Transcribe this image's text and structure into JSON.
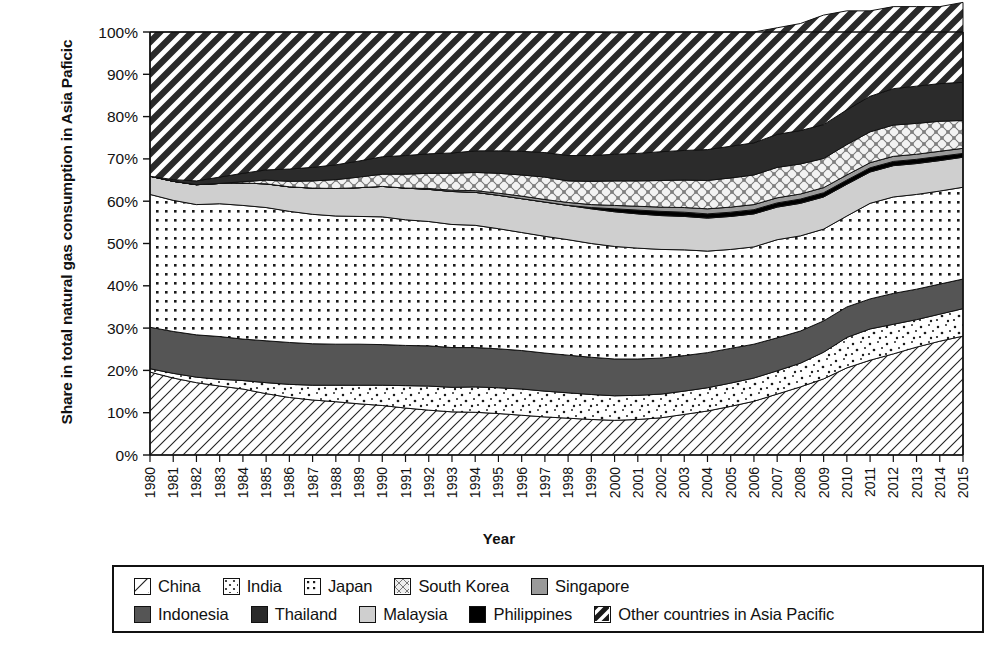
{
  "chart_data": {
    "type": "area",
    "title": "",
    "xlabel": "Year",
    "ylabel": "Share in total natural gas consumption in Asia Paficic",
    "stacked": true,
    "normalized": true,
    "grid": false,
    "legend_position": "bottom",
    "ylim": [
      0,
      100
    ],
    "ytick_labels": [
      "0%",
      "10%",
      "20%",
      "30%",
      "40%",
      "50%",
      "60%",
      "70%",
      "80%",
      "90%",
      "100%"
    ],
    "ytick_values": [
      0,
      10,
      20,
      30,
      40,
      50,
      60,
      70,
      80,
      90,
      100
    ],
    "categories": [
      "1980",
      "1981",
      "1982",
      "1983",
      "1984",
      "1985",
      "1986",
      "1987",
      "1988",
      "1989",
      "1990",
      "1991",
      "1992",
      "1993",
      "1994",
      "1995",
      "1996",
      "1997",
      "1998",
      "1999",
      "2000",
      "2001",
      "2002",
      "2003",
      "2004",
      "2005",
      "2006",
      "2007",
      "2008",
      "2009",
      "2010",
      "2011",
      "2012",
      "2013",
      "2014",
      "2015"
    ],
    "series": [
      {
        "name": "China",
        "pattern": "diagonal-hatch-light",
        "values": [
          19.6,
          18.2,
          17.1,
          16.3,
          15.6,
          14.5,
          13.6,
          13.0,
          12.6,
          12.1,
          11.7,
          11.1,
          10.6,
          10.2,
          10.1,
          9.8,
          9.4,
          9.0,
          8.7,
          8.4,
          8.2,
          8.4,
          8.8,
          9.6,
          10.4,
          11.5,
          12.7,
          14.4,
          16.1,
          18.0,
          20.6,
          22.4,
          23.9,
          25.5,
          26.9,
          28.1
        ]
      },
      {
        "name": "India",
        "pattern": "sparse-dots",
        "values": [
          0.8,
          1.1,
          1.3,
          1.6,
          2.0,
          2.6,
          3.1,
          3.5,
          3.9,
          4.4,
          4.8,
          5.3,
          5.7,
          5.8,
          6.0,
          6.1,
          6.2,
          6.1,
          6.0,
          5.9,
          5.8,
          5.7,
          5.6,
          5.5,
          5.5,
          5.5,
          5.5,
          5.5,
          5.6,
          6.3,
          7.2,
          7.4,
          7.0,
          6.5,
          6.4,
          6.5
        ]
      },
      {
        "name": "Indonesia",
        "pattern": "solid-dark-gray",
        "values": [
          9.8,
          9.9,
          10.0,
          10.1,
          9.8,
          9.9,
          9.9,
          9.8,
          9.7,
          9.7,
          9.6,
          9.5,
          9.5,
          9.4,
          9.3,
          9.2,
          9.1,
          9.0,
          8.9,
          8.8,
          8.7,
          8.6,
          8.5,
          8.4,
          8.3,
          8.2,
          8.0,
          7.8,
          7.6,
          7.4,
          7.2,
          7.1,
          7.3,
          7.2,
          7.1,
          7.0
        ]
      },
      {
        "name": "Japan",
        "pattern": "dot-grid",
        "values": [
          31.4,
          31.0,
          30.8,
          31.4,
          31.6,
          31.5,
          31.0,
          30.6,
          30.3,
          30.2,
          30.2,
          29.7,
          29.4,
          29.1,
          28.9,
          28.4,
          27.9,
          27.6,
          27.3,
          26.9,
          26.6,
          26.2,
          25.7,
          25.0,
          24.0,
          23.4,
          23.0,
          23.2,
          22.5,
          21.7,
          21.5,
          22.6,
          22.8,
          22.4,
          22.0,
          21.7
        ]
      },
      {
        "name": "Malaysia",
        "pattern": "solid-light-gray",
        "values": [
          4.3,
          4.5,
          4.7,
          4.8,
          5.3,
          5.6,
          5.8,
          6.2,
          6.5,
          6.8,
          7.2,
          7.5,
          7.6,
          7.8,
          7.8,
          7.9,
          8.0,
          8.1,
          8.1,
          8.2,
          8.2,
          8.1,
          8.0,
          7.9,
          7.8,
          7.8,
          7.8,
          7.7,
          7.7,
          7.6,
          7.5,
          7.4,
          7.4,
          7.3,
          7.2,
          7.1
        ]
      },
      {
        "name": "Philippines",
        "pattern": "solid-black",
        "values": [
          0.0,
          0.0,
          0.0,
          0.0,
          0.0,
          0.0,
          0.0,
          0.0,
          0.0,
          0.0,
          0.0,
          0.0,
          0.0,
          0.0,
          0.0,
          0.0,
          0.0,
          0.0,
          0.0,
          0.3,
          0.7,
          0.9,
          1.0,
          1.0,
          1.0,
          1.0,
          1.0,
          1.0,
          1.0,
          1.0,
          1.0,
          1.0,
          1.0,
          1.0,
          1.0,
          0.9
        ]
      },
      {
        "name": "Singapore",
        "pattern": "solid-medium-gray",
        "values": [
          0.0,
          0.0,
          0.0,
          0.0,
          0.0,
          0.0,
          0.0,
          0.0,
          0.0,
          0.0,
          0.0,
          0.0,
          0.2,
          0.3,
          0.4,
          0.5,
          0.6,
          0.6,
          0.7,
          0.7,
          0.8,
          0.9,
          1.0,
          1.1,
          1.2,
          1.2,
          1.2,
          1.2,
          1.2,
          1.2,
          1.2,
          1.2,
          1.2,
          1.2,
          1.2,
          1.2
        ]
      },
      {
        "name": "South Korea",
        "pattern": "cross-diamond",
        "values": [
          0.0,
          0.0,
          0.0,
          0.0,
          0.3,
          0.9,
          1.3,
          1.7,
          2.1,
          2.5,
          2.9,
          3.3,
          3.6,
          4.0,
          4.3,
          4.7,
          5.0,
          5.3,
          5.1,
          5.5,
          5.8,
          6.0,
          6.3,
          6.5,
          6.7,
          6.9,
          7.0,
          7.2,
          7.1,
          6.9,
          7.2,
          7.3,
          7.4,
          7.3,
          7.1,
          6.6
        ]
      },
      {
        "name": "Thailand",
        "pattern": "solid-very-dark",
        "values": [
          0.0,
          0.4,
          0.9,
          1.5,
          2.0,
          2.4,
          2.9,
          3.2,
          3.5,
          3.8,
          4.1,
          4.4,
          4.6,
          4.8,
          5.1,
          5.3,
          5.6,
          5.8,
          6.0,
          6.1,
          6.3,
          6.5,
          6.8,
          7.0,
          7.3,
          7.5,
          7.6,
          7.8,
          7.9,
          8.0,
          8.2,
          8.4,
          8.6,
          8.8,
          8.9,
          9.0
        ]
      },
      {
        "name": "Other countries in Asia Pacific",
        "pattern": "diagonal-hatch-heavy",
        "values": [
          34.1,
          34.9,
          35.2,
          34.3,
          33.4,
          32.6,
          32.4,
          32.0,
          31.4,
          30.5,
          29.5,
          29.2,
          28.8,
          28.6,
          28.1,
          28.1,
          28.2,
          28.5,
          29.2,
          29.2,
          28.7,
          28.7,
          28.3,
          28.0,
          27.8,
          27.0,
          26.2,
          25.2,
          25.3,
          25.9,
          23.4,
          20.2,
          19.4,
          18.8,
          18.2,
          18.9
        ]
      }
    ],
    "legend": [
      {
        "label": "China",
        "pattern": "diagonal-hatch-light"
      },
      {
        "label": "India",
        "pattern": "sparse-dots"
      },
      {
        "label": "Japan",
        "pattern": "dot-grid"
      },
      {
        "label": "South Korea",
        "pattern": "cross-diamond"
      },
      {
        "label": "Singapore",
        "pattern": "solid-medium-gray"
      },
      {
        "label": "Indonesia",
        "pattern": "solid-dark-gray"
      },
      {
        "label": "Thailand",
        "pattern": "solid-very-dark"
      },
      {
        "label": "Malaysia",
        "pattern": "solid-light-gray"
      },
      {
        "label": "Philippines",
        "pattern": "solid-black"
      },
      {
        "label": "Other countries in Asia Pacific",
        "pattern": "diagonal-hatch-heavy"
      }
    ],
    "colors": {
      "axis": "#111111",
      "solid-medium-gray": "#9a9a9a",
      "solid-dark-gray": "#555555",
      "solid-very-dark": "#2b2b2b",
      "solid-light-gray": "#cfcfcf",
      "solid-black": "#000000",
      "background": "#ffffff"
    }
  }
}
